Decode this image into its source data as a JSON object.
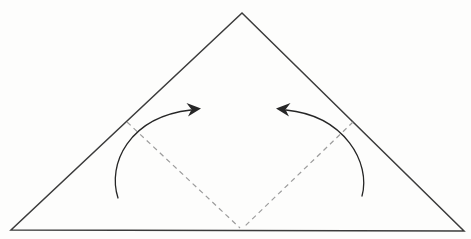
{
  "diagram": {
    "type": "origami-fold-step",
    "canvas": {
      "width": 471,
      "height": 239,
      "background": "#fdfdfc"
    },
    "colors": {
      "outline": "#3b3b3b",
      "fold_line": "#9c9c9c",
      "arrow": "#262626"
    },
    "stroke_widths": {
      "outline": 1.5,
      "fold_line": 1.2,
      "arrow": 1.3
    },
    "fold_dash_pattern": "5,4",
    "triangle": {
      "apex": [
        242,
        13
      ],
      "bottom_left": [
        11,
        230
      ],
      "bottom_right": [
        464,
        231
      ]
    },
    "fold_lines": [
      {
        "name": "left-valley-fold-line",
        "from": [
          127,
          122
        ],
        "to": [
          240,
          228
        ]
      },
      {
        "name": "right-valley-fold-line",
        "from": [
          353,
          122
        ],
        "to": [
          243,
          228
        ]
      }
    ],
    "arrows": [
      {
        "name": "left-fold-arrow",
        "curve": "M118,198 C107,164 129,117 191,110",
        "head": "M201,108.5 L186.5,103 L191.5,109.5 L188,116.5 Z"
      },
      {
        "name": "right-fold-arrow",
        "curve": "M362,196 C371,163 345,116 286,110",
        "head": "M276,108.5 L290.5,103 L285.5,109.5 L289,116.5 Z"
      }
    ]
  }
}
